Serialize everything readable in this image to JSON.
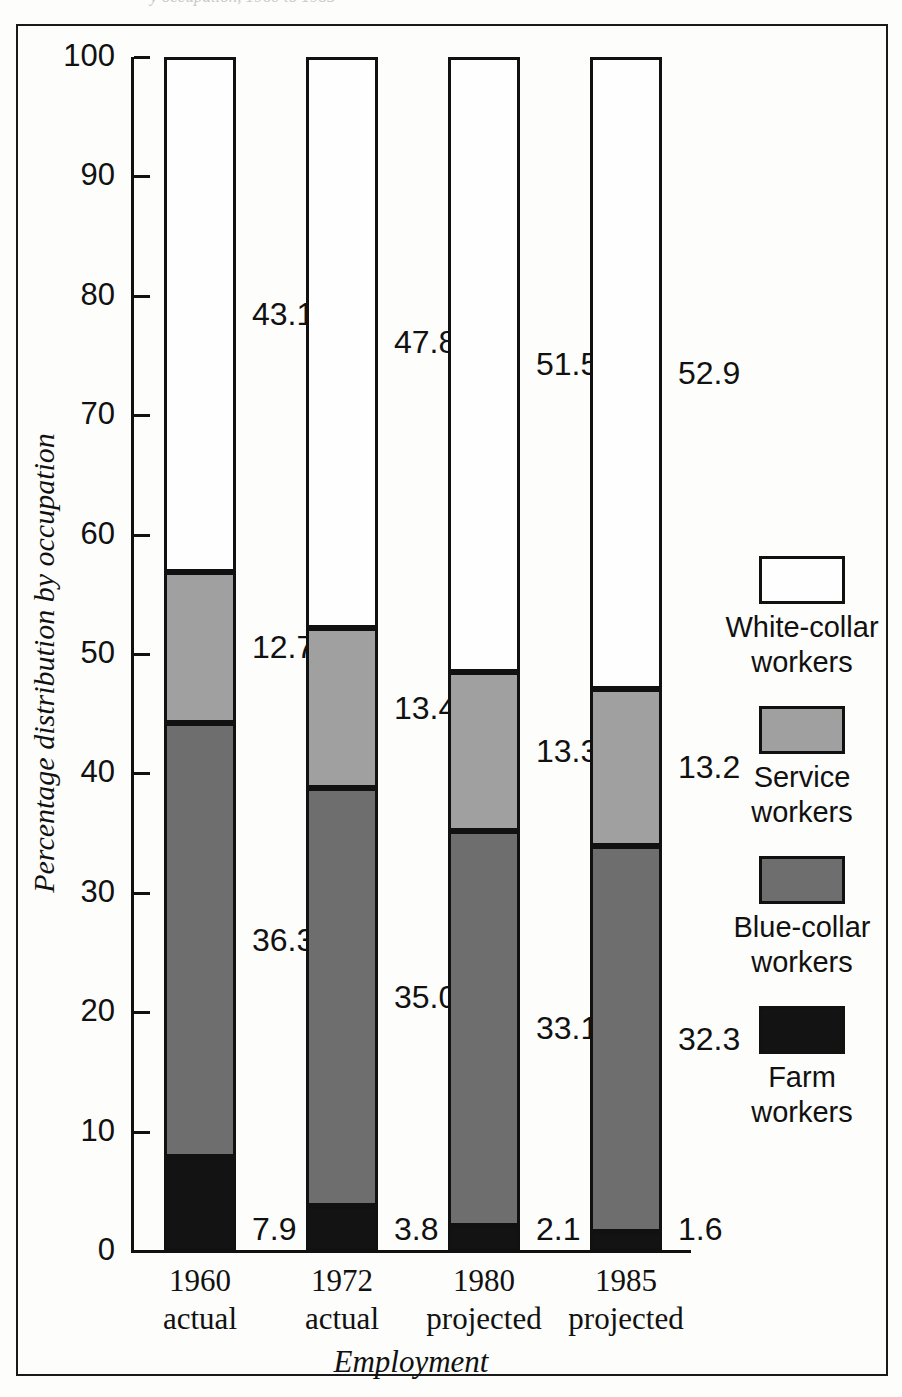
{
  "figure": {
    "cropped_title_fragment": "y occupation, 1960 to 1985"
  },
  "chart_data": {
    "type": "bar",
    "subtype": "stacked-bar-100-percent",
    "title": "",
    "xlabel": "Employment",
    "ylabel": "Percentage distribution by occupation",
    "ylim": [
      0,
      100
    ],
    "ytick_labels": [
      "100",
      "90",
      "80",
      "70",
      "60",
      "50",
      "40",
      "30",
      "20",
      "10",
      "0"
    ],
    "ytick_values": [
      100,
      90,
      80,
      70,
      60,
      50,
      40,
      30,
      20,
      10,
      0
    ],
    "grid": false,
    "legend_position": "right",
    "categories": [
      "1960\nactual",
      "1972\nactual",
      "1980\nprojected",
      "1985\nprojected"
    ],
    "category_lines": [
      {
        "year": "1960",
        "qualifier": "actual"
      },
      {
        "year": "1972",
        "qualifier": "actual"
      },
      {
        "year": "1980",
        "qualifier": "projected"
      },
      {
        "year": "1985",
        "qualifier": "projected"
      }
    ],
    "series": [
      {
        "name": "White-collar workers",
        "color": "#fefefe",
        "values": [
          43.1,
          47.8,
          51.5,
          52.9
        ],
        "labels": [
          "43.1",
          "47.8",
          "51.5",
          "52.9"
        ]
      },
      {
        "name": "Service workers",
        "color": "#a0a0a0",
        "values": [
          12.7,
          13.4,
          13.3,
          13.2
        ],
        "labels": [
          "12.7",
          "13.4",
          "13.3",
          "13.2"
        ]
      },
      {
        "name": "Blue-collar workers",
        "color": "#6e6e6e",
        "values": [
          36.3,
          35.0,
          33.1,
          32.3
        ],
        "labels": [
          "36.3",
          "35.0",
          "33.1",
          "32.3"
        ]
      },
      {
        "name": "Farm workers",
        "color": "#131313",
        "values": [
          7.9,
          3.8,
          2.1,
          1.6
        ],
        "labels": [
          "7.9",
          "3.8",
          "2.1",
          "1.6"
        ]
      }
    ]
  },
  "legend": {
    "items": [
      {
        "label_line1": "White-collar",
        "label_line2": "workers",
        "swatch": "white"
      },
      {
        "label_line1": "Service",
        "label_line2": "workers",
        "swatch": "service"
      },
      {
        "label_line1": "Blue-collar",
        "label_line2": "workers",
        "swatch": "blue"
      },
      {
        "label_line1": "Farm",
        "label_line2": "workers",
        "swatch": "farm"
      }
    ]
  }
}
